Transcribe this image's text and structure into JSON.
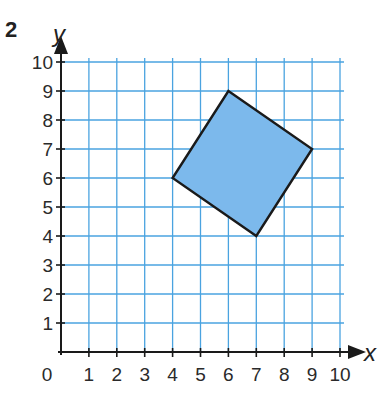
{
  "problem_number": "2",
  "axes": {
    "x_label": "x",
    "y_label": "y",
    "x_ticks": [
      "0",
      "1",
      "2",
      "3",
      "4",
      "5",
      "6",
      "7",
      "8",
      "9",
      "10"
    ],
    "y_ticks": [
      "1",
      "2",
      "3",
      "4",
      "5",
      "6",
      "7",
      "8",
      "9",
      "10"
    ],
    "xlim": [
      0,
      10
    ],
    "ylim": [
      0,
      10
    ]
  },
  "shape": {
    "type": "quadrilateral",
    "vertices": [
      [
        6,
        9
      ],
      [
        9,
        7
      ],
      [
        7,
        4
      ],
      [
        4,
        6
      ]
    ],
    "fill": "#7cb9ec",
    "stroke": "#1a1a1a"
  },
  "colors": {
    "grid": "#4aa3e0",
    "axis": "#1a1a1a"
  },
  "chart_data": {
    "type": "scatter",
    "title": "",
    "xlabel": "x",
    "ylabel": "y",
    "xlim": [
      0,
      10
    ],
    "ylim": [
      0,
      10
    ],
    "grid": true,
    "series": [
      {
        "name": "quadrilateral",
        "x": [
          6,
          9,
          7,
          4
        ],
        "y": [
          9,
          7,
          4,
          6
        ],
        "closed": true,
        "filled": true
      }
    ]
  }
}
